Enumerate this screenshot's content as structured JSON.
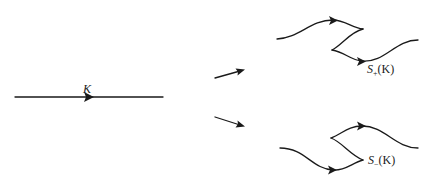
{
  "diagram": {
    "input_line": {
      "label": "K"
    },
    "upper_result": {
      "label_main": "S",
      "label_sub": "+",
      "label_arg": "(K)"
    },
    "lower_result": {
      "label_main": "S",
      "label_sub": "−",
      "label_arg": "(K)"
    },
    "colors": {
      "ink": "#1a1a1a",
      "background": "#ffffff"
    }
  }
}
